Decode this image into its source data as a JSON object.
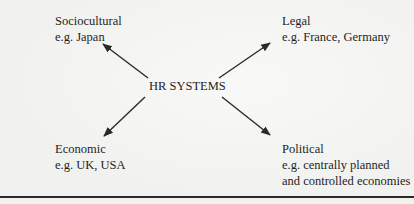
{
  "diagram": {
    "center": {
      "label": "HR SYSTEMS"
    },
    "nodes": [
      {
        "id": "sociocultural",
        "title": "Sociocultural",
        "example": [
          "e.g. Japan"
        ]
      },
      {
        "id": "legal",
        "title": "Legal",
        "example": [
          "e.g. France, Germany"
        ]
      },
      {
        "id": "economic",
        "title": "Economic",
        "example": [
          "e.g. UK, USA"
        ]
      },
      {
        "id": "political",
        "title": "Political",
        "example": [
          "e.g. centrally planned",
          "and controlled economies"
        ]
      }
    ],
    "edges": [
      {
        "from": "center",
        "to": "sociocultural",
        "direction": "up-left"
      },
      {
        "from": "center",
        "to": "legal",
        "direction": "up-right"
      },
      {
        "from": "center",
        "to": "economic",
        "direction": "down-left"
      },
      {
        "from": "center",
        "to": "political",
        "direction": "down-right"
      }
    ],
    "colors": {
      "ink": "#1e1e1e",
      "paper": "#f1f1ef",
      "arrow": "#2a2a2a"
    }
  }
}
